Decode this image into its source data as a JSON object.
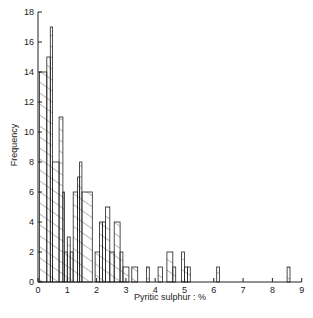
{
  "chart_data": {
    "type": "bar",
    "title": "",
    "xlabel": "Pyritic sulphur : %",
    "ylabel": "Frequency",
    "xlim": [
      0,
      9
    ],
    "ylim": [
      0,
      18
    ],
    "x_ticks": [
      0,
      1,
      2,
      3,
      4,
      5,
      6,
      7,
      8,
      9
    ],
    "y_ticks": [
      0,
      2,
      4,
      6,
      8,
      10,
      12,
      14,
      16,
      18
    ],
    "grid": false,
    "legend": null,
    "style": "stepped histogram with diagonal hatch fill",
    "bins": [
      {
        "x0": 0.05,
        "x1": 0.3,
        "value": 14
      },
      {
        "x0": 0.3,
        "x1": 0.42,
        "value": 15
      },
      {
        "x0": 0.42,
        "x1": 0.5,
        "value": 17
      },
      {
        "x0": 0.5,
        "x1": 0.72,
        "value": 8
      },
      {
        "x0": 0.72,
        "x1": 0.85,
        "value": 11
      },
      {
        "x0": 0.85,
        "x1": 0.9,
        "value": 6
      },
      {
        "x0": 0.9,
        "x1": 1.0,
        "value": 2
      },
      {
        "x0": 1.0,
        "x1": 1.1,
        "value": 3
      },
      {
        "x0": 1.1,
        "x1": 1.2,
        "value": 2
      },
      {
        "x0": 1.2,
        "x1": 1.35,
        "value": 6
      },
      {
        "x0": 1.35,
        "x1": 1.42,
        "value": 7
      },
      {
        "x0": 1.42,
        "x1": 1.5,
        "value": 8
      },
      {
        "x0": 1.5,
        "x1": 1.85,
        "value": 6
      },
      {
        "x0": 1.95,
        "x1": 2.1,
        "value": 2
      },
      {
        "x0": 2.1,
        "x1": 2.2,
        "value": 4
      },
      {
        "x0": 2.2,
        "x1": 2.3,
        "value": 4
      },
      {
        "x0": 2.3,
        "x1": 2.45,
        "value": 5
      },
      {
        "x0": 2.45,
        "x1": 2.6,
        "value": 2
      },
      {
        "x0": 2.6,
        "x1": 2.8,
        "value": 4
      },
      {
        "x0": 2.8,
        "x1": 2.9,
        "value": 2
      },
      {
        "x0": 2.9,
        "x1": 3.1,
        "value": 1
      },
      {
        "x0": 3.2,
        "x1": 3.4,
        "value": 1
      },
      {
        "x0": 3.7,
        "x1": 3.8,
        "value": 1
      },
      {
        "x0": 4.1,
        "x1": 4.25,
        "value": 1
      },
      {
        "x0": 4.4,
        "x1": 4.6,
        "value": 2
      },
      {
        "x0": 4.6,
        "x1": 4.7,
        "value": 1
      },
      {
        "x0": 4.9,
        "x1": 5.0,
        "value": 2
      },
      {
        "x0": 5.0,
        "x1": 5.1,
        "value": 1
      },
      {
        "x0": 5.1,
        "x1": 5.2,
        "value": 1
      },
      {
        "x0": 6.1,
        "x1": 6.2,
        "value": 1
      },
      {
        "x0": 8.5,
        "x1": 8.6,
        "value": 1
      }
    ]
  },
  "axes": {
    "xlabel": "Pyritic sulphur : %",
    "ylabel": "Frequency"
  }
}
